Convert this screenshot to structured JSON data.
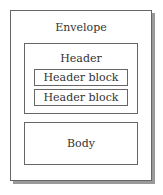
{
  "diagram": {
    "envelope": {
      "label": "Envelope"
    },
    "header": {
      "label": "Header",
      "blocks": [
        {
          "label": "Header block"
        },
        {
          "label": "Header block"
        }
      ]
    },
    "body": {
      "label": "Body"
    }
  }
}
